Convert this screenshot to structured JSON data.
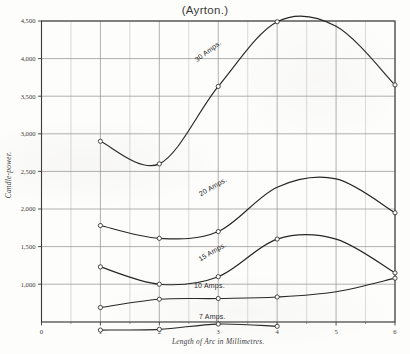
{
  "figure": {
    "title": "(Ayrton.)",
    "background_color": "#fdfdfb",
    "ink_color": "#2b2b2b",
    "grid_color": "#9a9a9a"
  },
  "chart_data": {
    "type": "line",
    "title": "(Ayrton.)",
    "xlabel": "Length of Arc in Millimetres.",
    "ylabel": "Candle-power.",
    "xlim": [
      0,
      6
    ],
    "ylim": [
      0,
      4500
    ],
    "xticks": [
      0,
      1,
      2,
      3,
      4,
      5,
      6
    ],
    "xtick_labels": [
      "0",
      "1",
      "2",
      "3",
      "4",
      "5",
      "6"
    ],
    "yticks": [
      1000,
      1500,
      2000,
      2500,
      3000,
      3500,
      4000,
      4500
    ],
    "ytick_labels": [
      "1,000",
      "1,500",
      "2,000",
      "2,500",
      "3,000",
      "3,500",
      "4,000",
      "4,500"
    ],
    "y_zero_label": "0",
    "grid": true,
    "minor_grid_x_step": 0.5,
    "legend": "inline-curve-labels",
    "series": [
      {
        "name": "30 Amps.",
        "label": "30 Amps.",
        "label_x": 2.85,
        "label_y": 4075,
        "label_rotation": -37,
        "x": [
          1,
          2,
          3,
          4,
          5,
          6
        ],
        "y": [
          2900,
          2600,
          3630,
          4490,
          4430,
          3650
        ],
        "markers_x": [
          1,
          2,
          3,
          4,
          6
        ],
        "markers_y": [
          2900,
          2600,
          3630,
          4490,
          3650
        ]
      },
      {
        "name": "20 Amps.",
        "label": "20 Amps.",
        "label_x": 2.93,
        "label_y": 2270,
        "label_rotation": -30,
        "x": [
          1,
          2,
          3,
          4,
          5,
          6
        ],
        "y": [
          1780,
          1610,
          1700,
          2290,
          2400,
          1950
        ],
        "markers_x": [
          1,
          2,
          3,
          6
        ],
        "markers_y": [
          1780,
          1610,
          1700,
          1950
        ]
      },
      {
        "name": "15 Amps.",
        "label": "15 Amps.",
        "label_x": 2.92,
        "label_y": 1405,
        "label_rotation": -30,
        "x": [
          1,
          2,
          3,
          4,
          5,
          6
        ],
        "y": [
          1230,
          1000,
          1100,
          1600,
          1600,
          1150
        ],
        "markers_x": [
          1,
          2,
          3,
          4,
          6
        ],
        "markers_y": [
          1230,
          1000,
          1100,
          1600,
          1150
        ]
      },
      {
        "name": "10 Amps.",
        "label": "10 Amps.",
        "label_x": 2.85,
        "label_y": 955,
        "label_rotation": 0,
        "x": [
          1,
          2,
          3,
          4,
          5,
          6
        ],
        "y": [
          690,
          800,
          810,
          830,
          900,
          1080
        ],
        "markers_x": [
          1,
          2,
          3,
          4,
          6
        ],
        "markers_y": [
          690,
          800,
          810,
          830,
          1080
        ]
      },
      {
        "name": "7 Amps.",
        "label": "7 Amps.",
        "label_x": 2.9,
        "label_y": 540,
        "label_rotation": 0,
        "x": [
          1,
          2,
          3,
          4
        ],
        "y": [
          390,
          400,
          470,
          440
        ],
        "markers_x": [
          1,
          2,
          3,
          4
        ],
        "markers_y": [
          390,
          400,
          470,
          440
        ]
      }
    ]
  }
}
